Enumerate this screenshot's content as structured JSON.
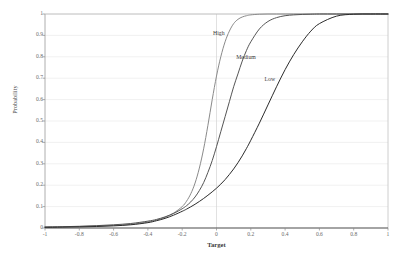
{
  "chart_data": {
    "type": "line",
    "title": "",
    "xlabel": "Target",
    "ylabel": "Probability",
    "xlim": [
      -1,
      1
    ],
    "ylim": [
      0,
      1
    ],
    "grid": true,
    "legend_position": "inline-annotations",
    "xticks": [
      "-1",
      "-0.8",
      "-0.6",
      "-0.4",
      "-0.2",
      "0",
      "0.2",
      "0.4",
      "0.6",
      "0.8",
      "1"
    ],
    "xtick_values": [
      -1,
      -0.8,
      -0.6,
      -0.4,
      -0.2,
      0,
      0.2,
      0.4,
      0.6,
      0.8,
      1
    ],
    "yticks": [
      "0",
      "0.1",
      "0.2",
      "0.3",
      "0.4",
      "0.5",
      "0.6",
      "0.7",
      "0.8",
      "0.9",
      "1"
    ],
    "ytick_values": [
      0,
      0.1,
      0.2,
      0.3,
      0.4,
      0.5,
      0.6,
      0.7,
      0.8,
      0.9,
      1
    ],
    "x": [
      -1,
      -0.9,
      -0.8,
      -0.7,
      -0.6,
      -0.5,
      -0.4,
      -0.35,
      -0.3,
      -0.25,
      -0.2,
      -0.175,
      -0.15,
      -0.125,
      -0.1,
      -0.075,
      -0.05,
      -0.025,
      0,
      0.025,
      0.05,
      0.075,
      0.1,
      0.125,
      0.15,
      0.175,
      0.2,
      0.25,
      0.3,
      0.35,
      0.4,
      0.45,
      0.5,
      0.55,
      0.6,
      0.7,
      0.8,
      0.9,
      1
    ],
    "series": [
      {
        "name": "High",
        "label": "High",
        "color": "#8a8a8a",
        "values": [
          0.004,
          0.005,
          0.007,
          0.009,
          0.012,
          0.017,
          0.028,
          0.037,
          0.05,
          0.07,
          0.1,
          0.125,
          0.16,
          0.21,
          0.28,
          0.37,
          0.48,
          0.6,
          0.71,
          0.8,
          0.87,
          0.92,
          0.955,
          0.975,
          0.986,
          0.992,
          0.996,
          0.999,
          1,
          1,
          1,
          1,
          1,
          1,
          1,
          1,
          1,
          1,
          1
        ]
      },
      {
        "name": "Medium",
        "label": "Medium",
        "color": "#555555",
        "values": [
          0.005,
          0.006,
          0.008,
          0.011,
          0.015,
          0.021,
          0.032,
          0.04,
          0.052,
          0.068,
          0.09,
          0.104,
          0.122,
          0.145,
          0.175,
          0.212,
          0.26,
          0.315,
          0.38,
          0.45,
          0.52,
          0.59,
          0.66,
          0.72,
          0.78,
          0.83,
          0.87,
          0.93,
          0.965,
          0.983,
          0.992,
          0.996,
          0.998,
          0.999,
          1,
          1,
          1,
          1,
          1
        ]
      },
      {
        "name": "Low",
        "label": "Low",
        "color": "#2b2b2b",
        "values": [
          0.003,
          0.004,
          0.005,
          0.007,
          0.01,
          0.015,
          0.025,
          0.034,
          0.045,
          0.06,
          0.078,
          0.088,
          0.099,
          0.111,
          0.124,
          0.138,
          0.153,
          0.169,
          0.186,
          0.205,
          0.226,
          0.25,
          0.276,
          0.305,
          0.337,
          0.372,
          0.41,
          0.49,
          0.575,
          0.66,
          0.74,
          0.81,
          0.87,
          0.92,
          0.955,
          0.99,
          0.999,
          1,
          1
        ]
      }
    ],
    "annotations": [
      {
        "text": "High",
        "x": -0.02,
        "y": 0.91
      },
      {
        "text": "Medium",
        "x": 0.115,
        "y": 0.8
      },
      {
        "text": "Low",
        "x": 0.28,
        "y": 0.695
      }
    ]
  },
  "colors": {
    "axis": "#7d7d7d",
    "grid": "#ebebeb",
    "zero_line": "#d4d4d4",
    "tick_text": "#6b6b6b",
    "background": "#ffffff"
  }
}
